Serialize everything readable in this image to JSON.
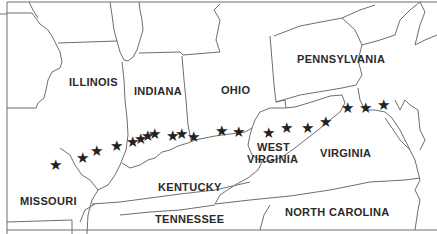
{
  "map": {
    "colors": {
      "border": "#6e6e6e",
      "land": "#ffffff",
      "star": "#222222",
      "text": "#2a2a2a"
    },
    "states": [
      {
        "name": "ILLINOIS",
        "x": 69,
        "y": 81
      },
      {
        "name": "INDIANA",
        "x": 134,
        "y": 86
      },
      {
        "name": "OHIO",
        "x": 221,
        "y": 85
      },
      {
        "name": "PENNSYLVANIA",
        "x": 297,
        "y": 53
      },
      {
        "name": "MISSOURI",
        "x": 20,
        "y": 199
      },
      {
        "name": "KENTUCKY",
        "x": 158,
        "y": 182
      },
      {
        "name": "TENNESSEE",
        "x": 155,
        "y": 213
      },
      {
        "name": "WEST",
        "x": 257,
        "y": 141
      },
      {
        "name": "VIRGINIA",
        "x": 247,
        "y": 153
      },
      {
        "name": "VIRGINIA",
        "x": 320,
        "y": 147
      },
      {
        "name": "NORTH CAROLINA",
        "x": 285,
        "y": 206
      }
    ],
    "star_icon": "★",
    "stars": [
      {
        "x": 55,
        "y": 165
      },
      {
        "x": 82,
        "y": 158
      },
      {
        "x": 96,
        "y": 151
      },
      {
        "x": 116,
        "y": 146
      },
      {
        "x": 132,
        "y": 142
      },
      {
        "x": 140,
        "y": 139
      },
      {
        "x": 147,
        "y": 136
      },
      {
        "x": 154,
        "y": 134
      },
      {
        "x": 172,
        "y": 136
      },
      {
        "x": 181,
        "y": 134
      },
      {
        "x": 193,
        "y": 137
      },
      {
        "x": 221,
        "y": 131
      },
      {
        "x": 238,
        "y": 132
      },
      {
        "x": 268,
        "y": 133
      },
      {
        "x": 286,
        "y": 128
      },
      {
        "x": 307,
        "y": 128
      },
      {
        "x": 325,
        "y": 122
      },
      {
        "x": 347,
        "y": 108
      },
      {
        "x": 365,
        "y": 108
      },
      {
        "x": 383,
        "y": 105
      }
    ]
  }
}
